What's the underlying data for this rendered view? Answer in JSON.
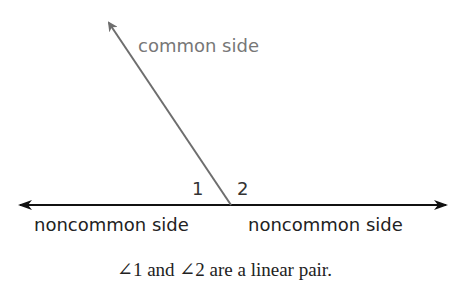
{
  "diagram": {
    "common_side_label": "common side",
    "angle1_label": "1",
    "angle2_label": "2",
    "left_side_label": "noncommon side",
    "right_side_label": "noncommon side",
    "caption": "∠1 and ∠2 are a linear pair.",
    "colors": {
      "line": "#111111",
      "common_ray": "#6e6e6e",
      "common_label": "#777777",
      "text": "#222222"
    }
  }
}
